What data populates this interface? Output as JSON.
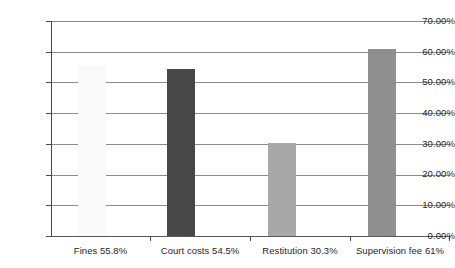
{
  "chart_data": {
    "type": "bar",
    "title": "",
    "subtitle": "",
    "xlabel": "",
    "ylabel": "",
    "categories": [
      "Fines 55.8%",
      "Court costs 54.5%",
      "Restitution 30.3%",
      "Supervision fee 61%"
    ],
    "series": [
      {
        "name": "Percent",
        "values": [
          55.8,
          54.5,
          30.3,
          61.0
        ]
      }
    ],
    "values": [
      55.8,
      54.5,
      30.3,
      61.0
    ],
    "bar_colors": [
      "#FAFAFA",
      "#474747",
      "#A8A8A8",
      "#8F8F8F"
    ],
    "ylim": [
      0,
      70
    ],
    "ytick_values": [
      70,
      60,
      50,
      40,
      30,
      20,
      10,
      0
    ],
    "ytick_labels": [
      "70.00%",
      "60.00%",
      "50.00%",
      "40.00%",
      "30.00%",
      "20.00%",
      "10.00%",
      "0.00%"
    ],
    "grid": true,
    "grid_axis": "y",
    "legend": false,
    "legend_position": "none",
    "annotations": [],
    "gridline_color": "#8A8A8A",
    "axis_color": "#4A4A4A",
    "background_color": "#FFFFFF",
    "text_color": "#1F1F1F"
  },
  "axis": {
    "y_ticks": [
      {
        "label": "70.00%",
        "value": 70
      },
      {
        "label": "60.00%",
        "value": 60
      },
      {
        "label": "50.00%",
        "value": 50
      },
      {
        "label": "40.00%",
        "value": 40
      },
      {
        "label": "30.00%",
        "value": 30
      },
      {
        "label": "20.00%",
        "value": 20
      },
      {
        "label": "10.00%",
        "value": 10
      },
      {
        "label": "0.00%",
        "value": 0
      }
    ]
  },
  "bars": [
    {
      "label": "Fines 55.8%",
      "value": 55.8,
      "color": "#FAFAFA"
    },
    {
      "label": "Court costs 54.5%",
      "value": 54.5,
      "color": "#474747"
    },
    {
      "label": "Restitution 30.3%",
      "value": 30.3,
      "color": "#A8A8A8"
    },
    {
      "label": "Supervision fee 61%",
      "value": 61.0,
      "color": "#8F8F8F"
    }
  ]
}
